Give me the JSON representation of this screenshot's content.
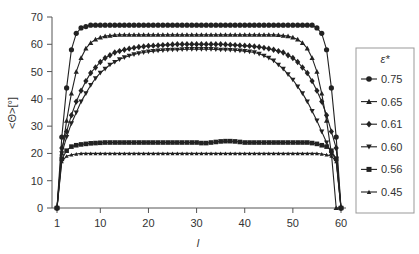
{
  "chart_data": {
    "type": "line",
    "title": "",
    "xlabel": "l",
    "ylabel": "<Θ>[°]",
    "xlim": [
      1,
      60
    ],
    "ylim": [
      0,
      70
    ],
    "xticks": [
      1,
      10,
      20,
      30,
      40,
      50,
      60
    ],
    "yticks": [
      0,
      10,
      20,
      30,
      40,
      50,
      60,
      70
    ],
    "grid": false,
    "legend": {
      "title": "ε*",
      "position": "right",
      "entries": [
        "0.75",
        "0.65",
        "0.61",
        "0.60",
        "0.56",
        "0.45"
      ]
    },
    "x": [
      1,
      2,
      3,
      4,
      5,
      6,
      7,
      8,
      9,
      10,
      11,
      12,
      13,
      14,
      15,
      16,
      17,
      18,
      19,
      20,
      21,
      22,
      23,
      24,
      25,
      26,
      27,
      28,
      29,
      30,
      31,
      32,
      33,
      34,
      35,
      36,
      37,
      38,
      39,
      40,
      41,
      42,
      43,
      44,
      45,
      46,
      47,
      48,
      49,
      50,
      51,
      52,
      53,
      54,
      55,
      56,
      57,
      58,
      59,
      60
    ],
    "series": [
      {
        "name": "0.75",
        "marker": "circle",
        "values": [
          0,
          26,
          44,
          58,
          64,
          66,
          66.5,
          67,
          67,
          67,
          67,
          67,
          67,
          67,
          67,
          67,
          67,
          67,
          67,
          67,
          67,
          67,
          67,
          67,
          67,
          67,
          67,
          67,
          67,
          67,
          67,
          67,
          67,
          67,
          67,
          67,
          67,
          67,
          67,
          67,
          67,
          67,
          67,
          67,
          67,
          67,
          67,
          67,
          67,
          67,
          67,
          67,
          67,
          67,
          66,
          64,
          58,
          44,
          26,
          0
        ]
      },
      {
        "name": "0.65",
        "marker": "triangle-up",
        "values": [
          0,
          20,
          32,
          42,
          50,
          55,
          58.5,
          60.5,
          61.8,
          62.5,
          63,
          63.2,
          63.4,
          63.5,
          63.5,
          63.5,
          63.5,
          63.5,
          63.5,
          63.5,
          63.5,
          63.5,
          63.5,
          63.5,
          63.5,
          63.5,
          63.5,
          63.5,
          63.5,
          63.5,
          63.5,
          63.5,
          63.5,
          63.5,
          63.5,
          63.5,
          63.5,
          63.5,
          63.5,
          63.5,
          63.5,
          63.5,
          63.5,
          63.5,
          63.5,
          63.5,
          63.4,
          63.2,
          63,
          62.5,
          61.8,
          60.5,
          58.5,
          55,
          50,
          42,
          32,
          20,
          0,
          0
        ]
      },
      {
        "name": "0.61",
        "marker": "diamond",
        "values": [
          0,
          22,
          28,
          34,
          39,
          43,
          46.5,
          49.5,
          51.5,
          53.5,
          55,
          56,
          57,
          57.5,
          58,
          58.4,
          58.7,
          59,
          59.2,
          59.4,
          59.5,
          59.6,
          59.7,
          59.8,
          59.9,
          60,
          60,
          60,
          60,
          60,
          60,
          60,
          60,
          60,
          60,
          59.9,
          59.8,
          59.7,
          59.6,
          59.5,
          59.4,
          59.2,
          59,
          58.7,
          58.4,
          58,
          57.5,
          57,
          56,
          55,
          53.5,
          51.5,
          49.5,
          46.5,
          43,
          39,
          34,
          28,
          22,
          0
        ]
      },
      {
        "name": "0.60",
        "marker": "triangle-down",
        "values": [
          0,
          20,
          26,
          31,
          35,
          39,
          42,
          45,
          47.5,
          49.5,
          51,
          52.5,
          53.5,
          54.5,
          55.2,
          55.8,
          56.3,
          56.7,
          57,
          57.3,
          57.5,
          57.7,
          57.8,
          57.9,
          58,
          58,
          58.1,
          58.2,
          58.2,
          58.2,
          58.2,
          58.2,
          58.2,
          58.1,
          58,
          58,
          57.9,
          57.8,
          57.7,
          57.5,
          57.3,
          57,
          56.5,
          55.8,
          55,
          54,
          52.5,
          51,
          49,
          47,
          44.5,
          42,
          39,
          35.5,
          32,
          28,
          24,
          20,
          18,
          0
        ]
      },
      {
        "name": "0.56",
        "marker": "square",
        "values": [
          0,
          18,
          21,
          22.5,
          23,
          23.3,
          23.5,
          23.7,
          23.8,
          23.9,
          24,
          24,
          24,
          24,
          24,
          24,
          24,
          24,
          24,
          24,
          24,
          24,
          24,
          24,
          24,
          24,
          24,
          24,
          24,
          24,
          23.8,
          23.8,
          24,
          24.2,
          24.4,
          24.5,
          24.5,
          24.4,
          24.2,
          24,
          24,
          24,
          24,
          24,
          24,
          24,
          24,
          24,
          24,
          24,
          24,
          24,
          24,
          23.8,
          23.5,
          23,
          22.5,
          21,
          18,
          0
        ]
      },
      {
        "name": "0.45",
        "marker": "triangle-up-small",
        "values": [
          0,
          17,
          19,
          19.5,
          19.8,
          20,
          20,
          20,
          20,
          20,
          20,
          20,
          20,
          20,
          20,
          20,
          20,
          20,
          20,
          20,
          20,
          20,
          20,
          20,
          20,
          20,
          20,
          20,
          20,
          20,
          20,
          20,
          20,
          20,
          20,
          20,
          20,
          20,
          20,
          20,
          20,
          20,
          20,
          20,
          20,
          20,
          20,
          20,
          20,
          20,
          20,
          20,
          20,
          20,
          20,
          19.8,
          19.5,
          19,
          17,
          0
        ]
      }
    ]
  },
  "axes": {
    "x_title": "l",
    "y_title": "<Θ>[°]"
  },
  "legend": {
    "title": "ε*"
  }
}
